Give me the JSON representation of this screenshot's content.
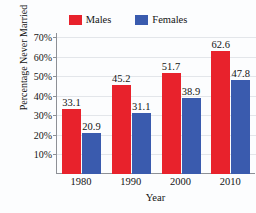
{
  "chart_data": {
    "type": "bar",
    "title": "",
    "xlabel": "Year",
    "ylabel": "Percentage Never Married",
    "categories": [
      "1980",
      "1990",
      "2000",
      "2010"
    ],
    "series": [
      {
        "name": "Males",
        "color": "#e8222c",
        "values": [
          33.1,
          45.2,
          51.7,
          62.6
        ],
        "labels": [
          "33.1",
          "45.2",
          "51.7",
          "62.6"
        ]
      },
      {
        "name": "Females",
        "color": "#3a5bae",
        "values": [
          20.9,
          31.1,
          38.9,
          47.8
        ],
        "labels": [
          "20.9",
          "31.1",
          "38.9",
          "47.8"
        ]
      }
    ],
    "ylim": [
      0,
      72
    ],
    "yticks": [
      10,
      20,
      30,
      40,
      50,
      60,
      70
    ],
    "ytick_labels": [
      "10%",
      "20%",
      "30%",
      "40%",
      "50%",
      "60%",
      "70%"
    ],
    "grid": true,
    "grid_axis": "y",
    "legend_position": "top-center",
    "bar_value_labels": true
  },
  "legend": {
    "entries": [
      {
        "label": "Males",
        "swatch": "#e8222c",
        "icon": "legend-swatch-males"
      },
      {
        "label": "Females",
        "swatch": "#3a5bae",
        "icon": "legend-swatch-females"
      }
    ]
  },
  "axes": {
    "y_title": "Percentage Never Married",
    "x_title": "Year",
    "y_tick_labels": [
      "70%",
      "60%",
      "50%",
      "40%",
      "30%",
      "20%",
      "10%"
    ],
    "x_tick_labels": [
      "1980",
      "1990",
      "2000",
      "2010"
    ]
  },
  "colors": {
    "males": "#e8222c",
    "females": "#3a5bae",
    "axis": "#8d9096",
    "grid": "#e3e6ea",
    "background": "#fcfdfe",
    "text": "#141414"
  }
}
